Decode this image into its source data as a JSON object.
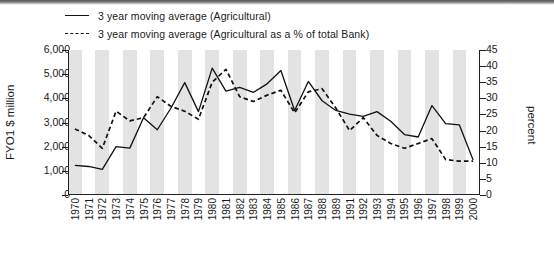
{
  "chart_data": {
    "type": "line",
    "title": "",
    "xlabel": "",
    "ylabel": "FYO1 $ million",
    "ylabel_right": "percent",
    "ylim": [
      0,
      6000
    ],
    "ylim_right": [
      0,
      45
    ],
    "yticks": [
      "0",
      "1,000",
      "2,000",
      "3,000",
      "4,000",
      "5,000",
      "6,000"
    ],
    "yticks_right": [
      "0",
      "5",
      "10",
      "15",
      "20",
      "25",
      "30",
      "35",
      "40",
      "45"
    ],
    "grid": false,
    "legend_position": "top-left",
    "categories": [
      "1970",
      "1971",
      "1972",
      "1973",
      "1974",
      "1975",
      "1976",
      "1977",
      "1978",
      "1979",
      "1980",
      "1981",
      "1982",
      "1983",
      "1984",
      "1985",
      "1986",
      "1987",
      "1988",
      "1989",
      "1991",
      "1992",
      "1993",
      "1994",
      "1995",
      "1996",
      "1997",
      "1998",
      "1999",
      "2000"
    ],
    "series": [
      {
        "name": "3 year moving average (Agricultural)",
        "axis": "left",
        "style": "solid",
        "color": "#111111",
        "values": [
          1230,
          1180,
          1060,
          2000,
          1940,
          3200,
          2700,
          3600,
          4650,
          3450,
          5250,
          4300,
          4450,
          4250,
          4600,
          5150,
          3500,
          4700,
          3900,
          3500,
          3350,
          3250,
          3450,
          3050,
          2500,
          2400,
          3700,
          2950,
          2900,
          1450
        ]
      },
      {
        "name": "3 year moving average (Agricultural as a % of total Bank)",
        "axis": "right",
        "style": "dashed",
        "color": "#111111",
        "values": [
          20.5,
          18.5,
          14.5,
          26.0,
          23.0,
          24.0,
          30.5,
          27.5,
          26.0,
          23.5,
          35.0,
          39.0,
          30.5,
          29.0,
          31.0,
          32.5,
          25.5,
          32.0,
          33.0,
          27.0,
          20.0,
          24.0,
          18.5,
          16.0,
          14.5,
          16.0,
          17.5,
          11.0,
          10.5,
          10.5
        ]
      }
    ]
  },
  "legend": {
    "items": [
      {
        "label": "3 year moving average (Agricultural)",
        "key": "solid-line-key"
      },
      {
        "label": "3 year moving average (Agricultural as a % of total Bank)",
        "key": "dashed-line-key"
      }
    ]
  }
}
